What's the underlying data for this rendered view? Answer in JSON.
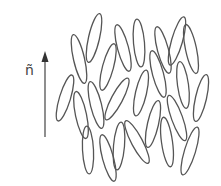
{
  "diagram": {
    "type": "nematic-liquid-crystal-director",
    "director_label": "ñ",
    "director_arrow": {
      "x": 45,
      "y_start": 137,
      "y_end": 50,
      "color": "#444444"
    },
    "stroke_color": "#555555",
    "molecules": [
      {
        "cx": 65,
        "cy": 98,
        "len": 48,
        "w": 11,
        "tilt": 17
      },
      {
        "cx": 79,
        "cy": 59,
        "len": 50,
        "w": 11,
        "tilt": -13
      },
      {
        "cx": 94,
        "cy": 38,
        "len": 50,
        "w": 11,
        "tilt": 13
      },
      {
        "cx": 81,
        "cy": 115,
        "len": 48,
        "w": 11,
        "tilt": -12
      },
      {
        "cx": 96,
        "cy": 105,
        "len": 48,
        "w": 11,
        "tilt": -14
      },
      {
        "cx": 108,
        "cy": 67,
        "len": 48,
        "w": 11,
        "tilt": 15
      },
      {
        "cx": 123,
        "cy": 48,
        "len": 48,
        "w": 11,
        "tilt": -15
      },
      {
        "cx": 117,
        "cy": 99,
        "len": 47,
        "w": 11,
        "tilt": 28
      },
      {
        "cx": 88,
        "cy": 150,
        "len": 48,
        "w": 11,
        "tilt": -3
      },
      {
        "cx": 108,
        "cy": 158,
        "len": 48,
        "w": 11,
        "tilt": -15
      },
      {
        "cx": 119,
        "cy": 146,
        "len": 48,
        "w": 11,
        "tilt": 5
      },
      {
        "cx": 137,
        "cy": 142,
        "len": 48,
        "w": 11,
        "tilt": -28
      },
      {
        "cx": 139,
        "cy": 43,
        "len": 48,
        "w": 11,
        "tilt": -5
      },
      {
        "cx": 141,
        "cy": 93,
        "len": 47,
        "w": 11,
        "tilt": 13
      },
      {
        "cx": 158,
        "cy": 74,
        "len": 48,
        "w": 11,
        "tilt": -15
      },
      {
        "cx": 153,
        "cy": 124,
        "len": 48,
        "w": 11,
        "tilt": 13
      },
      {
        "cx": 167,
        "cy": 142,
        "len": 50,
        "w": 11,
        "tilt": -8
      },
      {
        "cx": 163,
        "cy": 50,
        "len": 48,
        "w": 11,
        "tilt": -15
      },
      {
        "cx": 177,
        "cy": 41,
        "len": 50,
        "w": 11,
        "tilt": 16
      },
      {
        "cx": 191,
        "cy": 49,
        "len": 50,
        "w": 11,
        "tilt": -12
      },
      {
        "cx": 177,
        "cy": 118,
        "len": 48,
        "w": 11,
        "tilt": -20
      },
      {
        "cx": 183,
        "cy": 85,
        "len": 47,
        "w": 11,
        "tilt": -8
      },
      {
        "cx": 201,
        "cy": 98,
        "len": 48,
        "w": 11,
        "tilt": 13
      },
      {
        "cx": 190,
        "cy": 151,
        "len": 50,
        "w": 11,
        "tilt": 17
      }
    ]
  }
}
